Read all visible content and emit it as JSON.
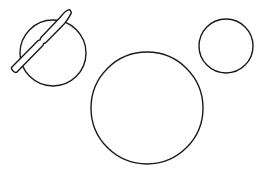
{
  "diagram": {
    "background": "#ffffff",
    "stroke_color": "#1a1a1a",
    "shapes": [
      {
        "id": "plate-left",
        "type": "circle",
        "cx": 53,
        "cy": 53,
        "r": 33
      },
      {
        "id": "plate-large",
        "type": "circle",
        "cx": 147,
        "cy": 108,
        "r": 56
      },
      {
        "id": "plate-small-right",
        "type": "circle",
        "cx": 226,
        "cy": 46,
        "r": 27
      },
      {
        "id": "knife",
        "type": "knife",
        "handle_end": [
          14,
          70
        ],
        "blade_tip": [
          71,
          12
        ],
        "laid_over": "plate-left"
      }
    ]
  }
}
